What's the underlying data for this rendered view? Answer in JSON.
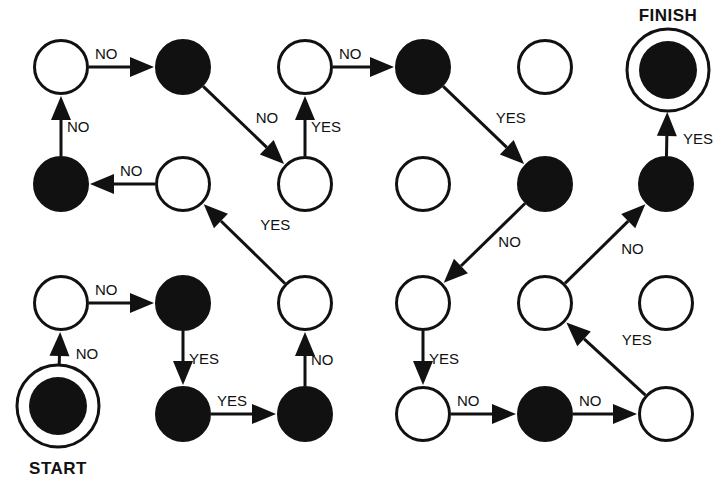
{
  "diagram": {
    "colors": {
      "ink": "#111111",
      "paper": "#ffffff"
    },
    "start_label": "START",
    "finish_label": "FINISH",
    "grid": {
      "columns": 6,
      "rows": 4
    },
    "nodes": [
      {
        "id": "r1c1",
        "row": 1,
        "col": 1,
        "fill": "white"
      },
      {
        "id": "r1c2",
        "row": 1,
        "col": 2,
        "fill": "black"
      },
      {
        "id": "r1c3",
        "row": 1,
        "col": 3,
        "fill": "white"
      },
      {
        "id": "r1c4",
        "row": 1,
        "col": 4,
        "fill": "black"
      },
      {
        "id": "r1c5",
        "row": 1,
        "col": 5,
        "fill": "white"
      },
      {
        "id": "r1c6",
        "row": 1,
        "col": 6,
        "fill": "black",
        "type": "finish"
      },
      {
        "id": "r2c1",
        "row": 2,
        "col": 1,
        "fill": "black"
      },
      {
        "id": "r2c2",
        "row": 2,
        "col": 2,
        "fill": "white"
      },
      {
        "id": "r2c3",
        "row": 2,
        "col": 3,
        "fill": "white"
      },
      {
        "id": "r2c4",
        "row": 2,
        "col": 4,
        "fill": "white"
      },
      {
        "id": "r2c5",
        "row": 2,
        "col": 5,
        "fill": "black"
      },
      {
        "id": "r2c6",
        "row": 2,
        "col": 6,
        "fill": "black"
      },
      {
        "id": "r3c1",
        "row": 3,
        "col": 1,
        "fill": "white"
      },
      {
        "id": "r3c2",
        "row": 3,
        "col": 2,
        "fill": "black"
      },
      {
        "id": "r3c3",
        "row": 3,
        "col": 3,
        "fill": "white"
      },
      {
        "id": "r3c4",
        "row": 3,
        "col": 4,
        "fill": "white"
      },
      {
        "id": "r3c5",
        "row": 3,
        "col": 5,
        "fill": "white"
      },
      {
        "id": "r3c6",
        "row": 3,
        "col": 6,
        "fill": "white"
      },
      {
        "id": "r4c1",
        "row": 4,
        "col": 1,
        "fill": "black",
        "type": "start"
      },
      {
        "id": "r4c2",
        "row": 4,
        "col": 2,
        "fill": "black"
      },
      {
        "id": "r4c3",
        "row": 4,
        "col": 3,
        "fill": "black"
      },
      {
        "id": "r4c4",
        "row": 4,
        "col": 4,
        "fill": "white"
      },
      {
        "id": "r4c5",
        "row": 4,
        "col": 5,
        "fill": "black"
      },
      {
        "id": "r4c6",
        "row": 4,
        "col": 6,
        "fill": "white"
      }
    ],
    "edges": [
      {
        "from": "r4c1",
        "to": "r3c1",
        "label": "NO"
      },
      {
        "from": "r3c1",
        "to": "r3c2",
        "label": "NO"
      },
      {
        "from": "r3c2",
        "to": "r4c2",
        "label": "YES"
      },
      {
        "from": "r4c2",
        "to": "r4c3",
        "label": "YES"
      },
      {
        "from": "r4c3",
        "to": "r3c3",
        "label": "NO"
      },
      {
        "from": "r3c3",
        "to": "r2c2",
        "label": "YES"
      },
      {
        "from": "r2c2",
        "to": "r2c1",
        "label": "NO"
      },
      {
        "from": "r2c1",
        "to": "r1c1",
        "label": "NO"
      },
      {
        "from": "r1c1",
        "to": "r1c2",
        "label": "NO"
      },
      {
        "from": "r1c2",
        "to": "r2c3",
        "label": "NO"
      },
      {
        "from": "r2c3",
        "to": "r1c3",
        "label": "YES"
      },
      {
        "from": "r1c3",
        "to": "r1c4",
        "label": "NO"
      },
      {
        "from": "r1c4",
        "to": "r2c5",
        "label": "YES"
      },
      {
        "from": "r2c5",
        "to": "r3c4",
        "label": "NO"
      },
      {
        "from": "r3c4",
        "to": "r4c4",
        "label": "YES"
      },
      {
        "from": "r4c4",
        "to": "r4c5",
        "label": "NO"
      },
      {
        "from": "r4c5",
        "to": "r4c6",
        "label": "NO"
      },
      {
        "from": "r4c6",
        "to": "r3c5",
        "label": "YES"
      },
      {
        "from": "r3c5",
        "to": "r2c6",
        "label": "NO"
      },
      {
        "from": "r2c6",
        "to": "r1c6",
        "label": "YES"
      }
    ]
  }
}
